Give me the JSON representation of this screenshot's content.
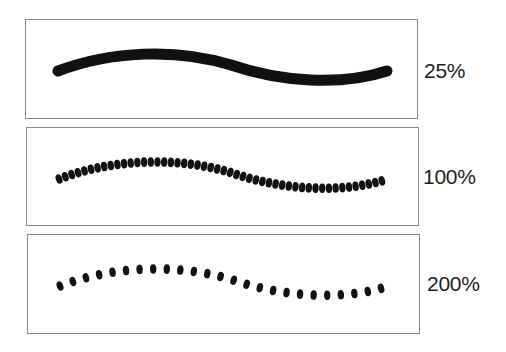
{
  "figure": {
    "panels": [
      {
        "id": "spacing-25",
        "label": "25%",
        "spacing_percent": 25,
        "render": "solid-stroke",
        "box": {
          "left": 25,
          "top": 19,
          "width": 393,
          "height": 100
        },
        "label_pos": {
          "left": 424,
          "top": 60
        },
        "stroke_color": "#111111",
        "stroke_width": 11
      },
      {
        "id": "spacing-100",
        "label": "100%",
        "spacing_percent": 100,
        "render": "dots",
        "dot_step": 6.7,
        "dot_rx": 3.2,
        "dot_ry": 4.8,
        "box": {
          "left": 26,
          "top": 127,
          "width": 393,
          "height": 99
        },
        "label_pos": {
          "left": 423,
          "top": 166
        },
        "stroke_color": "#111111"
      },
      {
        "id": "spacing-200",
        "label": "200%",
        "spacing_percent": 200,
        "render": "dots",
        "dot_step": 13.6,
        "dot_rx": 3.2,
        "dot_ry": 4.8,
        "box": {
          "left": 27,
          "top": 234,
          "width": 393,
          "height": 100
        },
        "label_pos": {
          "left": 427,
          "top": 273
        },
        "stroke_color": "#111111"
      }
    ],
    "curve_path": "M32,51 C85,31 150,28 205,45 C255,62 315,66 361,51",
    "colors": {
      "border": "#8a8a8a",
      "ink": "#111111",
      "label": "#1e1e1e",
      "background": "#ffffff"
    }
  }
}
